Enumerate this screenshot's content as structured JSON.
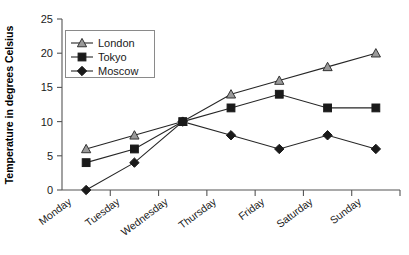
{
  "chart_data": {
    "type": "line",
    "title": "",
    "xlabel": "",
    "ylabel": "Temperature in degrees Celsius",
    "categories": [
      "Monday",
      "Tuesday",
      "Wednesday",
      "Thursday",
      "Friday",
      "Saturday",
      "Sunday"
    ],
    "ylim": [
      0,
      25
    ],
    "yticks": [
      0,
      5,
      10,
      15,
      20,
      25
    ],
    "ytick_labels": [
      "0",
      "5",
      "10",
      "15",
      "20",
      "25"
    ],
    "grid": false,
    "legend_position": "top-left",
    "series": [
      {
        "name": "London",
        "marker": "triangle",
        "marker_fill": "#9a9a9a",
        "line_color": "#262626",
        "values": [
          6,
          8,
          10,
          14,
          16,
          18,
          20
        ]
      },
      {
        "name": "Tokyo",
        "marker": "square",
        "marker_fill": "#1a1a1a",
        "line_color": "#262626",
        "values": [
          4,
          6,
          10,
          12,
          14,
          12,
          12
        ]
      },
      {
        "name": "Moscow",
        "marker": "diamond",
        "marker_fill": "#1a1a1a",
        "line_color": "#262626",
        "values": [
          0,
          4,
          10,
          8,
          6,
          8,
          6
        ]
      }
    ]
  },
  "colors": {
    "axis": "#555555",
    "text": "#1a1a1a",
    "line": "#262626",
    "legend_border": "#8a8a8a",
    "background": "#ffffff"
  }
}
